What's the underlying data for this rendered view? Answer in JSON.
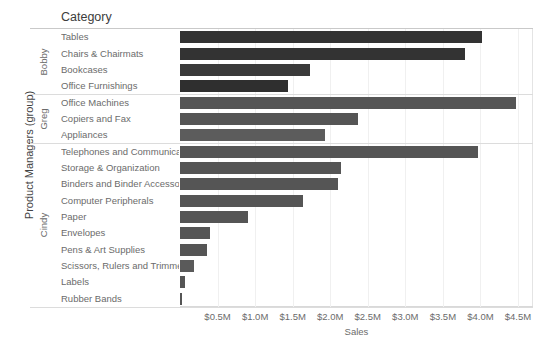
{
  "axes": {
    "y_title": "Product Managers (group)",
    "x_title": "Sales",
    "category_header": "Category"
  },
  "groups": [
    {
      "name": "Bobby",
      "count": 4
    },
    {
      "name": "Greg",
      "count": 3
    },
    {
      "name": "Cindy",
      "count": 10
    }
  ],
  "x_ticks": [
    {
      "label": "$0.5M",
      "value": 0.5
    },
    {
      "label": "$1.0M",
      "value": 1.0
    },
    {
      "label": "$1.5M",
      "value": 1.5
    },
    {
      "label": "$2.0M",
      "value": 2.0
    },
    {
      "label": "$2.5M",
      "value": 2.5
    },
    {
      "label": "$3.0M",
      "value": 3.0
    },
    {
      "label": "$3.5M",
      "value": 3.5
    },
    {
      "label": "$4.0M",
      "value": 4.0
    },
    {
      "label": "$4.5M",
      "value": 4.5
    }
  ],
  "colors": {
    "bar_dark": "#333333",
    "bar_mid": "#4a4a4a",
    "bar_light": "#5a5a5a",
    "gridline": "#f0f0f0",
    "rule": "#dcdcdc",
    "text": "#6b6b6b"
  },
  "chart_data": {
    "type": "bar",
    "orientation": "horizontal",
    "title": "",
    "xlabel": "Sales",
    "ylabel": "Product Managers (group)",
    "xlim": [
      0,
      4.62
    ],
    "xunit": "M",
    "grid": true,
    "legend": "none",
    "categories": [
      "Tables",
      "Chairs & Chairmats",
      "Bookcases",
      "Office Furnishings",
      "Office Machines",
      "Copiers and Fax",
      "Appliances",
      "Telephones and Communicati..",
      "Storage & Organization",
      "Binders and Binder Accessori",
      "Computer Peripherals",
      "Paper",
      "Envelopes",
      "Pens & Art Supplies",
      "Scissors, Rulers and Trimmers",
      "Labels",
      "Rubber Bands"
    ],
    "values": [
      4.02,
      3.79,
      1.73,
      1.44,
      4.47,
      2.37,
      1.93,
      3.97,
      2.14,
      2.1,
      1.64,
      0.91,
      0.4,
      0.36,
      0.19,
      0.07,
      0.03
    ],
    "group_of": [
      "Bobby",
      "Bobby",
      "Bobby",
      "Bobby",
      "Greg",
      "Greg",
      "Greg",
      "Cindy",
      "Cindy",
      "Cindy",
      "Cindy",
      "Cindy",
      "Cindy",
      "Cindy",
      "Cindy",
      "Cindy"
    ],
    "bar_colors": [
      "#333333",
      "#333333",
      "#3a3a3a",
      "#2f2f2f",
      "#555555",
      "#555555",
      "#5c5c5c",
      "#555555",
      "#555555",
      "#555555",
      "#555555",
      "#555555",
      "#555555",
      "#555555",
      "#5a5a5a",
      "#555555",
      "#555555"
    ]
  }
}
